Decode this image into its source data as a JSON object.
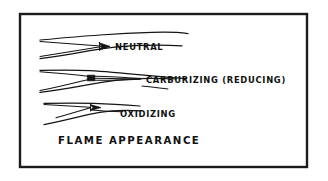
{
  "figure": {
    "caption": "FLAME APPEARANCE",
    "background_color": "#ffffff",
    "ink_color": "#141414",
    "frame": {
      "name": "diagram-border",
      "x": 20,
      "y": 14,
      "width": 287,
      "height": 153,
      "stroke_color": "#1a1a1a"
    }
  },
  "flames": [
    {
      "id": "neutral",
      "label": "NEUTRAL",
      "label_x": 115,
      "label_y": 48,
      "cone_marker": "arrow-wedge",
      "description": "long tapering envelope with short pointed inner cone"
    },
    {
      "id": "carburizing",
      "label": "CARBURIZING (REDUCING)",
      "label_x": 146,
      "label_y": 82,
      "cone_marker": "solid-box",
      "description": "envelope with dark inner cone box and feather streamers"
    },
    {
      "id": "oxidizing",
      "label": "OXIDIZING",
      "label_x": 120,
      "label_y": 116,
      "cone_marker": "arrow-wedge",
      "description": "narrow sharp short inner cone"
    }
  ]
}
